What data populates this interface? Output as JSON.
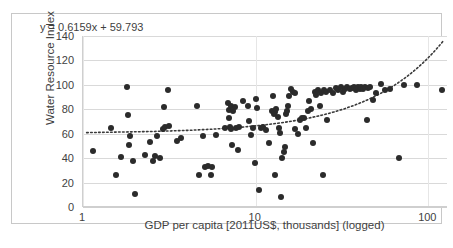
{
  "chart_data": {
    "type": "scatter",
    "title": "",
    "xlabel": "GDP per capita [2011US$, thousands] (logged)",
    "ylabel": "Water Resource Index",
    "xscale": "log",
    "xlim": [
      1,
      130
    ],
    "ylim": [
      0,
      140
    ],
    "yticks": [
      0,
      20,
      40,
      60,
      80,
      100,
      120,
      140
    ],
    "xticks": [
      1,
      10,
      100
    ],
    "xtick_labels": [
      "1",
      "10",
      "100"
    ],
    "grid": "horizontal",
    "legend": "none",
    "annotations": [
      {
        "name": "trendline-equation",
        "text": "y = 0.6159x + 59.793"
      }
    ],
    "trendline": {
      "style": "dotted",
      "equation": "y = 0.6159x + 59.793",
      "slope": 0.6159,
      "intercept": 59.793,
      "x_start": 1.05,
      "y_start": 60.1,
      "x_end": 125,
      "y_end": 130.0
    },
    "series": [
      {
        "name": "Countries",
        "marker": "filled-circle",
        "color": "#2b2b2b",
        "points": [
          [
            1.15,
            45.5
          ],
          [
            1.45,
            64.5
          ],
          [
            1.55,
            26.5
          ],
          [
            1.65,
            41.0
          ],
          [
            1.8,
            98.5
          ],
          [
            1.82,
            75.5
          ],
          [
            1.85,
            51.0
          ],
          [
            1.88,
            58.5
          ],
          [
            1.95,
            37.5
          ],
          [
            2.0,
            11.0
          ],
          [
            2.3,
            42.5
          ],
          [
            2.45,
            53.5
          ],
          [
            2.55,
            38.0
          ],
          [
            2.62,
            42.0
          ],
          [
            2.7,
            58.5
          ],
          [
            2.8,
            40.0
          ],
          [
            2.9,
            64.0
          ],
          [
            2.95,
            82.0
          ],
          [
            3.0,
            65.5
          ],
          [
            3.1,
            96.0
          ],
          [
            3.15,
            66.0
          ],
          [
            3.5,
            54.0
          ],
          [
            3.7,
            56.5
          ],
          [
            4.6,
            83.0
          ],
          [
            4.7,
            26.0
          ],
          [
            4.95,
            58.5
          ],
          [
            5.1,
            32.5
          ],
          [
            5.3,
            33.5
          ],
          [
            5.5,
            26.5
          ],
          [
            5.6,
            33.0
          ],
          [
            5.9,
            59.0
          ],
          [
            6.6,
            64.5
          ],
          [
            6.9,
            85.5
          ],
          [
            7.0,
            79.5
          ],
          [
            7.05,
            73.0
          ],
          [
            7.1,
            65.5
          ],
          [
            7.15,
            64.0
          ],
          [
            7.2,
            82.5
          ],
          [
            7.25,
            50.5
          ],
          [
            7.4,
            78.5
          ],
          [
            7.6,
            81.5
          ],
          [
            7.7,
            64.5
          ],
          [
            7.9,
            46.5
          ],
          [
            8.0,
            65.5
          ],
          [
            8.5,
            87.0
          ],
          [
            9.0,
            82.5
          ],
          [
            9.1,
            70.5
          ],
          [
            9.4,
            59.0
          ],
          [
            9.6,
            64.5
          ],
          [
            9.9,
            36.0
          ],
          [
            10.0,
            88.5
          ],
          [
            10.2,
            81.0
          ],
          [
            10.5,
            14.0
          ],
          [
            10.8,
            65.0
          ],
          [
            11.0,
            65.5
          ],
          [
            11.5,
            63.0
          ],
          [
            12.0,
            52.0
          ],
          [
            12.4,
            79.0
          ],
          [
            12.6,
            90.5
          ],
          [
            12.8,
            76.5
          ],
          [
            12.9,
            77.5
          ],
          [
            13.0,
            26.5
          ],
          [
            13.2,
            80.0
          ],
          [
            13.4,
            73.5
          ],
          [
            13.6,
            64.5
          ],
          [
            13.8,
            60.5
          ],
          [
            14.0,
            8.0
          ],
          [
            14.2,
            40.0
          ],
          [
            14.5,
            45.0
          ],
          [
            14.8,
            49.5
          ],
          [
            15.0,
            76.5
          ],
          [
            15.2,
            78.5
          ],
          [
            15.4,
            83.0
          ],
          [
            15.6,
            91.0
          ],
          [
            16.0,
            96.5
          ],
          [
            16.4,
            94.0
          ],
          [
            16.8,
            93.5
          ],
          [
            17.0,
            64.0
          ],
          [
            17.5,
            59.5
          ],
          [
            18.0,
            71.5
          ],
          [
            18.5,
            72.5
          ],
          [
            19.0,
            73.0
          ],
          [
            19.5,
            65.0
          ],
          [
            20.0,
            78.5
          ],
          [
            20.5,
            87.0
          ],
          [
            21.0,
            80.5
          ],
          [
            21.5,
            52.5
          ],
          [
            22.0,
            94.5
          ],
          [
            22.5,
            92.0
          ],
          [
            23.0,
            95.5
          ],
          [
            23.5,
            82.5
          ],
          [
            24.0,
            93.0
          ],
          [
            24.5,
            26.0
          ],
          [
            25.0,
            96.0
          ],
          [
            25.5,
            94.0
          ],
          [
            26.0,
            71.0
          ],
          [
            27.0,
            95.5
          ],
          [
            28.0,
            93.5
          ],
          [
            29.0,
            97.5
          ],
          [
            30.0,
            96.0
          ],
          [
            31.0,
            98.0
          ],
          [
            32.0,
            94.5
          ],
          [
            33.0,
            97.0
          ],
          [
            34.0,
            98.5
          ],
          [
            35.0,
            96.5
          ],
          [
            36.0,
            97.5
          ],
          [
            37.0,
            98.0
          ],
          [
            38.0,
            96.0
          ],
          [
            39.0,
            98.5
          ],
          [
            40.0,
            97.0
          ],
          [
            41.0,
            98.0
          ],
          [
            42.0,
            96.5
          ],
          [
            43.0,
            98.0
          ],
          [
            44.0,
            71.5
          ],
          [
            45.0,
            97.5
          ],
          [
            46.0,
            98.5
          ],
          [
            48.0,
            88.0
          ],
          [
            50.0,
            93.0
          ],
          [
            53.0,
            100.5
          ],
          [
            56.0,
            95.5
          ],
          [
            60.0,
            96.5
          ],
          [
            68.0,
            40.0
          ],
          [
            72.0,
            100.0
          ],
          [
            86.0,
            100.0
          ],
          [
            120.0,
            96.0
          ]
        ]
      }
    ]
  },
  "axes": {
    "y_title": "Water Resource Index",
    "x_title": "GDP per capita [2011US$, thousands] (logged)",
    "y_tick_labels": [
      "140",
      "120",
      "100",
      "80",
      "60",
      "40",
      "20",
      "0"
    ],
    "x_tick_labels": [
      "1",
      "10",
      "100"
    ]
  },
  "equation_label": "y = 0.6159x + 59.793",
  "colors": {
    "marker": "#2b2b2b",
    "gridline": "#d9d9d9",
    "frame": "#c8c8c8",
    "text": "#3f3f3f",
    "background": "#ffffff"
  }
}
